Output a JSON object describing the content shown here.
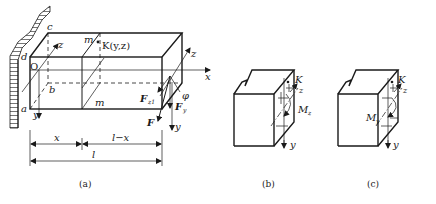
{
  "figure_a": {
    "caption": "(a)",
    "labels": {
      "c": "c",
      "d": "d",
      "origin": "O",
      "a": "a",
      "b": "b",
      "z_left": "z",
      "y_left": "y",
      "m_top": "m",
      "m_bottom": "m",
      "point_k": "K(y,z)",
      "x_axis": "x",
      "z_right": "z",
      "y_right": "y",
      "phi": "φ",
      "force_f": "F",
      "force_fz": "F",
      "force_fz_sub": "z1",
      "force_fy": "F",
      "force_fy_sub": "y"
    },
    "dimensions": {
      "segment_1": "x",
      "segment_2": "l−x",
      "total": "l"
    }
  },
  "figure_b": {
    "caption": "(b)",
    "labels": {
      "point_k": "K",
      "z_axis": "z",
      "y_axis": "y",
      "moment": "M",
      "moment_sub": "z"
    }
  },
  "figure_c": {
    "caption": "(c)",
    "labels": {
      "point_k": "K",
      "z_axis": "z",
      "y_axis": "y",
      "moment": "M",
      "moment_sub": "y"
    }
  }
}
